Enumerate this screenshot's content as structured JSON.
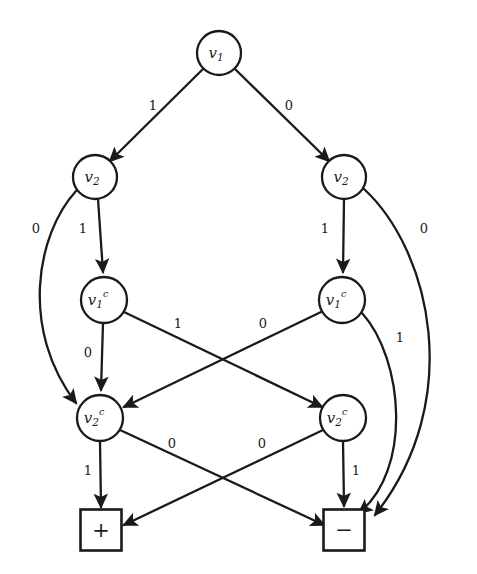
{
  "diagram": {
    "kind": "decision-diagram",
    "canvas": {
      "width": 477,
      "height": 574
    },
    "colors": {
      "background": "#ffffff",
      "stroke": "#1a1a1a",
      "node_fill": "#ffffff"
    },
    "nodes": [
      {
        "id": "v1",
        "base": "v",
        "sub": "1",
        "sup": "",
        "shape": "circle",
        "cx": 219,
        "cy": 53,
        "r": 22
      },
      {
        "id": "v2-left",
        "base": "v",
        "sub": "2",
        "sup": "",
        "shape": "circle",
        "cx": 95,
        "cy": 177,
        "r": 22
      },
      {
        "id": "v2-right",
        "base": "v",
        "sub": "2",
        "sup": "",
        "shape": "circle",
        "cx": 344,
        "cy": 177,
        "r": 22
      },
      {
        "id": "v1c-left",
        "base": "v",
        "sub": "1",
        "sup": "c",
        "shape": "circle",
        "cx": 104,
        "cy": 300,
        "r": 23
      },
      {
        "id": "v1c-right",
        "base": "v",
        "sub": "1",
        "sup": "c",
        "shape": "circle",
        "cx": 342,
        "cy": 300,
        "r": 23
      },
      {
        "id": "v2c-left",
        "base": "v",
        "sub": "2",
        "sup": "c",
        "shape": "circle",
        "cx": 100,
        "cy": 418,
        "r": 23
      },
      {
        "id": "v2c-right",
        "base": "v",
        "sub": "2",
        "sup": "c",
        "shape": "circle",
        "cx": 343,
        "cy": 418,
        "r": 23
      },
      {
        "id": "plus",
        "base": "+",
        "sub": "",
        "sup": "",
        "shape": "square",
        "cx": 101,
        "cy": 530,
        "size": 41
      },
      {
        "id": "minus",
        "base": "−",
        "sub": "",
        "sup": "",
        "shape": "square",
        "cx": 344,
        "cy": 530,
        "size": 41
      }
    ],
    "edges": [
      {
        "id": "e1",
        "from": "v1",
        "to": "v2-left",
        "label": "1",
        "label_x": 153,
        "label_y": 106
      },
      {
        "id": "e2",
        "from": "v1",
        "to": "v2-right",
        "label": "0",
        "label_x": 289,
        "label_y": 106
      },
      {
        "id": "e3",
        "from": "v2-left",
        "to": "v1c-left",
        "label": "1",
        "label_x": 83,
        "label_y": 229
      },
      {
        "id": "e4",
        "from": "v2-left",
        "to": "v2c-left",
        "label": "0",
        "label_x": 36,
        "label_y": 229,
        "curved": true
      },
      {
        "id": "e5",
        "from": "v2-right",
        "to": "v1c-right",
        "label": "1",
        "label_x": 325,
        "label_y": 229
      },
      {
        "id": "e6",
        "from": "v2-right",
        "to": "minus",
        "label": "0",
        "label_x": 424,
        "label_y": 229,
        "curved": true
      },
      {
        "id": "e7",
        "from": "v1c-left",
        "to": "v2c-left",
        "label": "0",
        "label_x": 88,
        "label_y": 353
      },
      {
        "id": "e8",
        "from": "v1c-left",
        "to": "v2c-right",
        "label": "1",
        "label_x": 178,
        "label_y": 324
      },
      {
        "id": "e9",
        "from": "v1c-right",
        "to": "v2c-left",
        "label": "0",
        "label_x": 263,
        "label_y": 324
      },
      {
        "id": "e10",
        "from": "v1c-right",
        "to": "minus",
        "label": "1",
        "label_x": 400,
        "label_y": 338,
        "curved": true
      },
      {
        "id": "e11",
        "from": "v2c-left",
        "to": "plus",
        "label": "1",
        "label_x": 88,
        "label_y": 471
      },
      {
        "id": "e12",
        "from": "v2c-left",
        "to": "minus",
        "label": "0",
        "label_x": 172,
        "label_y": 444
      },
      {
        "id": "e13",
        "from": "v2c-right",
        "to": "plus",
        "label": "0",
        "label_x": 262,
        "label_y": 444
      },
      {
        "id": "e14",
        "from": "v2c-right",
        "to": "minus",
        "label": "1",
        "label_x": 356,
        "label_y": 471
      }
    ]
  }
}
